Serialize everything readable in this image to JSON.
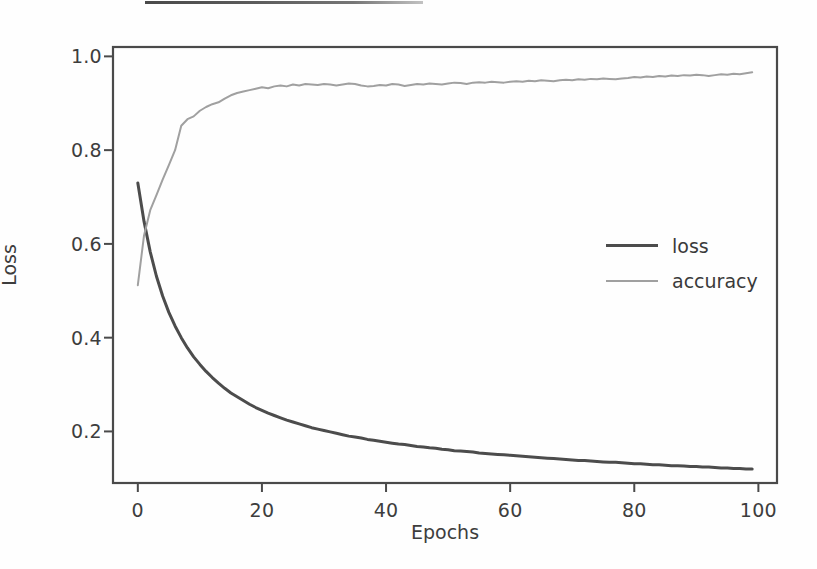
{
  "figure": {
    "background_color": "#fefefe",
    "artifact": {
      "name": "scan-line-artifact",
      "visible": true
    }
  },
  "chart_data": {
    "type": "line",
    "title": "",
    "xlabel": "Epochs",
    "ylabel": "Loss",
    "xlim": [
      -4,
      103
    ],
    "ylim": [
      0.09,
      1.02
    ],
    "xticks": [
      "0",
      "20",
      "40",
      "60",
      "80",
      "100"
    ],
    "xtick_values": [
      0,
      20,
      40,
      60,
      80,
      100
    ],
    "yticks": [
      "1.0",
      "0.8",
      "0.6",
      "0.4",
      "0.2"
    ],
    "ytick_values": [
      1.0,
      0.8,
      0.6,
      0.4,
      0.2
    ],
    "grid": false,
    "legend_position": "center right",
    "legend_entries": [
      "loss",
      "accuracy"
    ],
    "colors": {
      "loss": "#4c4c4c",
      "accuracy": "#a0a0a0",
      "axes": "#4a4a4a",
      "text": "#3d3d3d"
    },
    "x": [
      0,
      1,
      2,
      3,
      4,
      5,
      6,
      7,
      8,
      9,
      10,
      11,
      12,
      13,
      14,
      15,
      16,
      17,
      18,
      19,
      20,
      21,
      22,
      23,
      24,
      25,
      26,
      27,
      28,
      29,
      30,
      31,
      32,
      33,
      34,
      35,
      36,
      37,
      38,
      39,
      40,
      41,
      42,
      43,
      44,
      45,
      46,
      47,
      48,
      49,
      50,
      51,
      52,
      53,
      54,
      55,
      56,
      57,
      58,
      59,
      60,
      61,
      62,
      63,
      64,
      65,
      66,
      67,
      68,
      69,
      70,
      71,
      72,
      73,
      74,
      75,
      76,
      77,
      78,
      79,
      80,
      81,
      82,
      83,
      84,
      85,
      86,
      87,
      88,
      89,
      90,
      91,
      92,
      93,
      94,
      95,
      96,
      97,
      98,
      99
    ],
    "series": [
      {
        "name": "loss",
        "values": [
          0.73,
          0.648,
          0.583,
          0.531,
          0.489,
          0.454,
          0.425,
          0.4,
          0.378,
          0.359,
          0.343,
          0.328,
          0.315,
          0.303,
          0.292,
          0.282,
          0.274,
          0.266,
          0.258,
          0.251,
          0.245,
          0.239,
          0.234,
          0.229,
          0.224,
          0.22,
          0.216,
          0.212,
          0.208,
          0.205,
          0.202,
          0.199,
          0.196,
          0.193,
          0.19,
          0.188,
          0.186,
          0.183,
          0.181,
          0.179,
          0.177,
          0.175,
          0.173,
          0.172,
          0.17,
          0.168,
          0.167,
          0.165,
          0.164,
          0.162,
          0.161,
          0.159,
          0.158,
          0.157,
          0.156,
          0.154,
          0.153,
          0.152,
          0.151,
          0.15,
          0.149,
          0.148,
          0.147,
          0.146,
          0.145,
          0.144,
          0.143,
          0.142,
          0.141,
          0.14,
          0.139,
          0.138,
          0.138,
          0.137,
          0.136,
          0.135,
          0.134,
          0.134,
          0.133,
          0.132,
          0.131,
          0.131,
          0.13,
          0.129,
          0.129,
          0.128,
          0.127,
          0.127,
          0.126,
          0.125,
          0.125,
          0.124,
          0.124,
          0.123,
          0.122,
          0.122,
          0.121,
          0.121,
          0.12,
          0.12
        ]
      },
      {
        "name": "accuracy",
        "values": [
          0.512,
          0.618,
          0.672,
          0.704,
          0.737,
          0.768,
          0.8,
          0.852,
          0.866,
          0.872,
          0.884,
          0.892,
          0.898,
          0.902,
          0.91,
          0.917,
          0.922,
          0.925,
          0.928,
          0.931,
          0.934,
          0.932,
          0.936,
          0.938,
          0.936,
          0.94,
          0.938,
          0.941,
          0.94,
          0.939,
          0.941,
          0.94,
          0.938,
          0.94,
          0.942,
          0.941,
          0.938,
          0.936,
          0.937,
          0.939,
          0.938,
          0.941,
          0.94,
          0.937,
          0.939,
          0.941,
          0.94,
          0.942,
          0.941,
          0.94,
          0.942,
          0.944,
          0.943,
          0.941,
          0.944,
          0.945,
          0.944,
          0.946,
          0.945,
          0.944,
          0.946,
          0.947,
          0.946,
          0.948,
          0.947,
          0.949,
          0.948,
          0.947,
          0.949,
          0.95,
          0.949,
          0.951,
          0.95,
          0.952,
          0.951,
          0.953,
          0.952,
          0.951,
          0.953,
          0.954,
          0.956,
          0.955,
          0.957,
          0.956,
          0.958,
          0.957,
          0.959,
          0.958,
          0.96,
          0.959,
          0.961,
          0.96,
          0.958,
          0.96,
          0.962,
          0.961,
          0.963,
          0.962,
          0.964,
          0.966
        ]
      }
    ]
  }
}
